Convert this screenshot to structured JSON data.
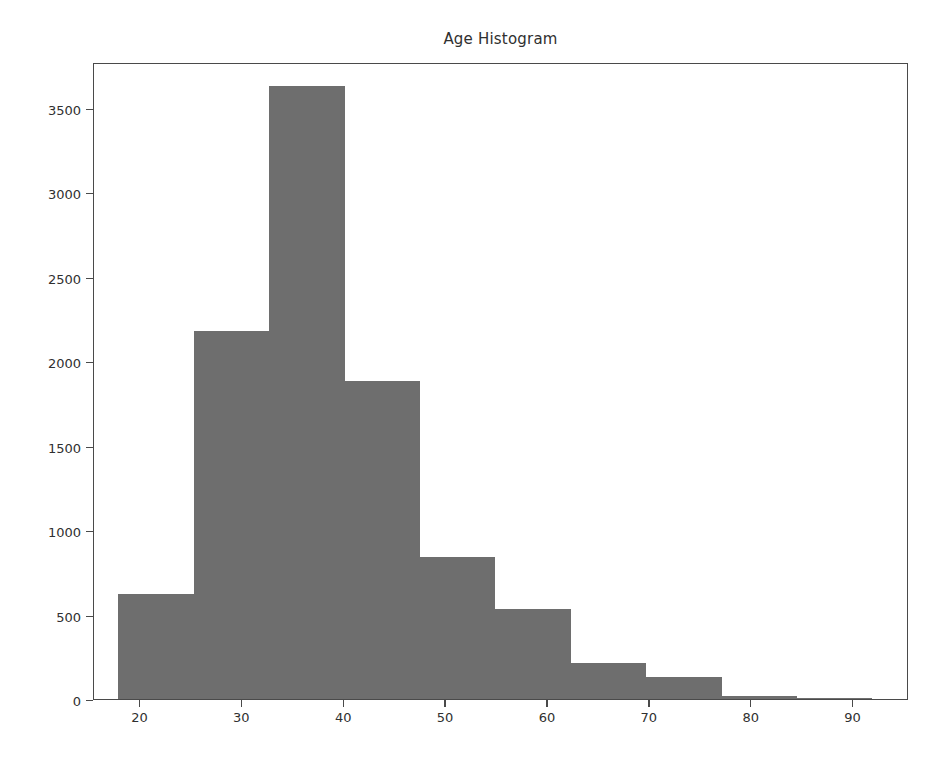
{
  "chart_data": {
    "type": "bar",
    "title": "Age Histogram",
    "xlabel": "",
    "ylabel": "",
    "grid": false,
    "legend": null,
    "xlim": [
      15.5,
      95.5
    ],
    "ylim": [
      0,
      3770
    ],
    "xticks": [
      20,
      30,
      40,
      50,
      60,
      70,
      80,
      90
    ],
    "xtick_labels": [
      "20",
      "30",
      "40",
      "50",
      "60",
      "70",
      "80",
      "90"
    ],
    "yticks": [
      0,
      500,
      1000,
      1500,
      2000,
      2500,
      3000,
      3500
    ],
    "ytick_labels": [
      "0",
      "500",
      "1000",
      "1500",
      "2000",
      "2500",
      "3000",
      "3500"
    ],
    "bin_edges": [
      17.9,
      25.3,
      32.7,
      40.1,
      47.5,
      54.9,
      62.3,
      69.7,
      77.1,
      84.5,
      91.9
    ],
    "categories": [
      "17.9-25.3",
      "25.3-32.7",
      "32.7-40.1",
      "40.1-47.5",
      "47.5-54.9",
      "54.9-62.3",
      "62.3-69.7",
      "69.7-77.1",
      "77.1-84.5",
      "84.5-91.9"
    ],
    "values": [
      620,
      2180,
      3630,
      1880,
      840,
      530,
      215,
      130,
      20,
      5
    ],
    "bar_color": "#6e6e6e",
    "axes_color": "#4a4a4a",
    "background": "#ffffff"
  }
}
